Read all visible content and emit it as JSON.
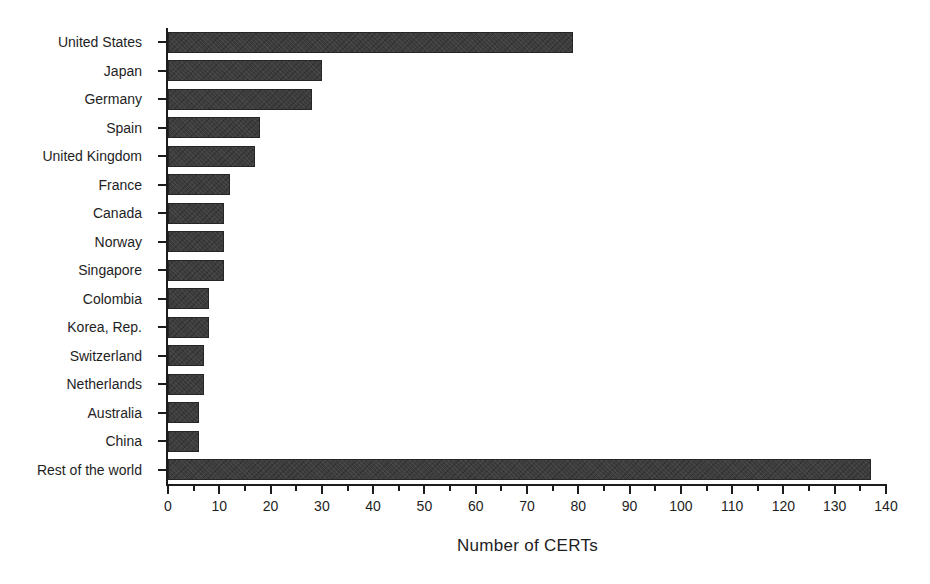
{
  "chart_data": {
    "type": "bar",
    "orientation": "horizontal",
    "title": "",
    "xlabel": "Number of CERTs",
    "ylabel": "",
    "categories": [
      "United States",
      "Japan",
      "Germany",
      "Spain",
      "United Kingdom",
      "France",
      "Canada",
      "Norway",
      "Singapore",
      "Colombia",
      "Korea, Rep.",
      "Switzerland",
      "Netherlands",
      "Australia",
      "China",
      "Rest of the world"
    ],
    "values": [
      79,
      30,
      28,
      18,
      17,
      12,
      11,
      11,
      11,
      8,
      8,
      7,
      7,
      6,
      6,
      137
    ],
    "xlim": [
      0,
      140
    ],
    "x_major_ticks": [
      0,
      10,
      20,
      30,
      40,
      50,
      60,
      70,
      80,
      90,
      100,
      110,
      120,
      130,
      140
    ],
    "x_minor_tick_step": 5,
    "grid": "off",
    "legend": "none",
    "bar_color": "#3d3d3d",
    "axis_color": "#1c1c1c",
    "text_color": "#1e1e1e",
    "background_color": "#ffffff"
  }
}
